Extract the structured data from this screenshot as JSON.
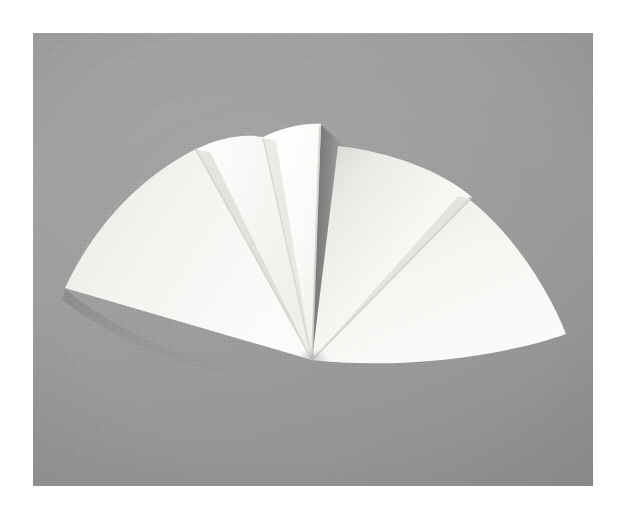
{
  "scene": {
    "title": "Folded paper fan on gray backdrop",
    "subject": "white paper folded into five radiating sectors",
    "background_color": "#9a9c9c",
    "paper_color": "#f8f8f6",
    "border_color": "#ffffff",
    "shadow_color": "#7e8080",
    "frame": {
      "x": 33,
      "y": 33,
      "width": 560,
      "height": 453
    },
    "apex": {
      "x": 312,
      "y": 360
    },
    "caption": "",
    "sectors": [
      {
        "id": "sector-1",
        "name": "leftmost-sector",
        "fill": "#f0f0ed",
        "tip_label": "outer left tip",
        "outer_corner": {
          "x": 65,
          "y": 287
        },
        "arc_top": {
          "x": 196,
          "y": 148
        }
      },
      {
        "id": "sector-2",
        "name": "left-sector",
        "fill": "#f7f7f4",
        "tip_label": "second flap",
        "outer_corner": {
          "x": 196,
          "y": 148
        },
        "arc_top": {
          "x": 263,
          "y": 137
        }
      },
      {
        "id": "sector-3",
        "name": "center-sector",
        "fill": "#fbfbf9",
        "tip_label": "tallest flap",
        "outer_corner": {
          "x": 263,
          "y": 137
        },
        "arc_top": {
          "x": 320,
          "y": 124
        }
      },
      {
        "id": "sector-4",
        "name": "right-center-sector",
        "fill": "#f3f3f0",
        "tip_label": "shaded flap",
        "outer_corner": {
          "x": 338,
          "y": 146
        },
        "arc_top": {
          "x": 470,
          "y": 196
        }
      },
      {
        "id": "sector-5",
        "name": "rightmost-sector",
        "fill": "#f6f6f3",
        "tip_label": "outer right tip",
        "outer_corner": {
          "x": 470,
          "y": 200
        },
        "arc_top": {
          "x": 566,
          "y": 334
        }
      }
    ],
    "creases": [
      {
        "name": "crease-1",
        "from": {
          "x": 312,
          "y": 360
        },
        "to": {
          "x": 196,
          "y": 149
        }
      },
      {
        "name": "crease-2",
        "from": {
          "x": 312,
          "y": 360
        },
        "to": {
          "x": 263,
          "y": 138
        }
      },
      {
        "name": "crease-3",
        "from": {
          "x": 312,
          "y": 360
        },
        "to": {
          "x": 320,
          "y": 125
        }
      },
      {
        "name": "crease-4",
        "from": {
          "x": 312,
          "y": 360
        },
        "to": {
          "x": 470,
          "y": 198
        }
      }
    ],
    "notches": [
      {
        "name": "notch-left",
        "x": 196,
        "y": 148
      },
      {
        "name": "notch-right",
        "x": 470,
        "y": 197
      }
    ]
  }
}
